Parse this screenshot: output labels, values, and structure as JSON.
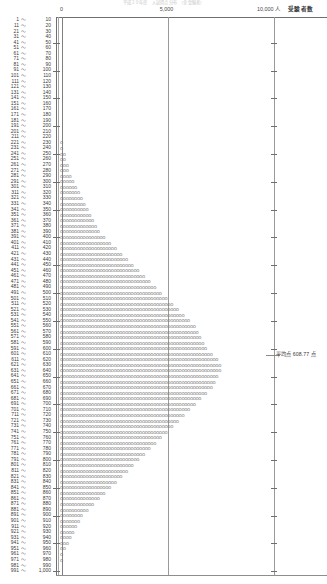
{
  "top_clipped_text": "平成２９年度　入試得点分布　（全受験者）",
  "axis": {
    "unit_suffix": "人",
    "name": "受験者数",
    "ticks": [
      {
        "value": 0,
        "label": "0"
      },
      {
        "value": 5000,
        "label": "5,000"
      },
      {
        "value": 10000,
        "label": "10,000"
      }
    ],
    "xlim": [
      0,
      10000
    ]
  },
  "annotation": {
    "average_label": "平均点 608.77 点",
    "average_value": 608.77
  },
  "chart_data": {
    "type": "bar",
    "orientation": "horizontal",
    "title": "入試得点分布",
    "xlabel": "受験者数",
    "ylabel": "",
    "xlim": [
      0,
      10000
    ],
    "grid": true,
    "legend": null,
    "glyph": "o",
    "glyph_value": 140,
    "categories": [
      "1 ～ 10",
      "11 ～ 20",
      "21 ～ 30",
      "31 ～ 40",
      "41 ～ 50",
      "51 ～ 60",
      "61 ～ 70",
      "71 ～ 80",
      "81 ～ 90",
      "91 ～ 100",
      "101 ～ 110",
      "111 ～ 120",
      "121 ～ 130",
      "131 ～ 140",
      "141 ～ 150",
      "151 ～ 160",
      "161 ～ 170",
      "171 ～ 180",
      "181 ～ 190",
      "191 ～ 200",
      "201 ～ 210",
      "211 ～ 220",
      "221 ～ 230",
      "231 ～ 240",
      "241 ～ 250",
      "251 ～ 260",
      "261 ～ 270",
      "271 ～ 280",
      "281 ～ 290",
      "291 ～ 300",
      "301 ～ 310",
      "311 ～ 320",
      "321 ～ 330",
      "331 ～ 340",
      "341 ～ 350",
      "351 ～ 360",
      "361 ～ 370",
      "371 ～ 380",
      "381 ～ 390",
      "391 ～ 400",
      "401 ～ 410",
      "411 ～ 420",
      "421 ～ 430",
      "431 ～ 440",
      "441 ～ 450",
      "451 ～ 460",
      "461 ～ 470",
      "471 ～ 480",
      "481 ～ 490",
      "491 ～ 500",
      "501 ～ 510",
      "511 ～ 520",
      "521 ～ 530",
      "531 ～ 540",
      "541 ～ 550",
      "551 ～ 560",
      "561 ～ 570",
      "571 ～ 580",
      "581 ～ 590",
      "591 ～ 600",
      "601 ～ 610",
      "611 ～ 620",
      "621 ～ 630",
      "631 ～ 640",
      "641 ～ 650",
      "651 ～ 660",
      "661 ～ 670",
      "671 ～ 680",
      "681 ～ 690",
      "691 ～ 700",
      "701 ～ 710",
      "711 ～ 720",
      "721 ～ 730",
      "731 ～ 740",
      "741 ～ 750",
      "751 ～ 760",
      "761 ～ 770",
      "771 ～ 780",
      "781 ～ 790",
      "791 ～ 800",
      "801 ～ 810",
      "811 ～ 820",
      "821 ～ 830",
      "831 ～ 840",
      "841 ～ 850",
      "851 ～ 860",
      "861 ～ 870",
      "871 ～ 880",
      "881 ～ 890",
      "891 ～ 900",
      "901 ～ 910",
      "911 ～ 920",
      "921 ～ 930",
      "931 ～ 940",
      "941 ～ 950",
      "951 ～ 960",
      "961 ～ 970",
      "971 ～ 980",
      "981 ～ 990",
      "991 ～ 1,000"
    ],
    "values": [
      0,
      0,
      0,
      0,
      0,
      0,
      0,
      0,
      0,
      0,
      0,
      0,
      0,
      0,
      0,
      0,
      0,
      0,
      0,
      0,
      0,
      0,
      140,
      140,
      280,
      280,
      420,
      420,
      560,
      700,
      840,
      980,
      1120,
      1260,
      1400,
      1540,
      1680,
      1820,
      1960,
      2240,
      2520,
      2800,
      3080,
      3360,
      3640,
      3920,
      4200,
      4480,
      4760,
      5040,
      5320,
      5600,
      5880,
      6160,
      6440,
      6720,
      6860,
      7000,
      7140,
      7280,
      7560,
      7840,
      7980,
      7980,
      7840,
      7700,
      7560,
      7280,
      7000,
      6720,
      6440,
      6160,
      5880,
      5600,
      5320,
      5040,
      4760,
      4480,
      4200,
      3920,
      3640,
      3360,
      3080,
      2800,
      2520,
      2240,
      1960,
      1680,
      1400,
      1120,
      980,
      840,
      700,
      560,
      420,
      280,
      140,
      140,
      0,
      0
    ],
    "glyph_counts": [
      0,
      0,
      0,
      0,
      0,
      0,
      0,
      0,
      0,
      0,
      0,
      0,
      0,
      0,
      0,
      0,
      0,
      0,
      0,
      0,
      0,
      0,
      1,
      1,
      2,
      2,
      3,
      3,
      4,
      5,
      6,
      7,
      8,
      9,
      10,
      11,
      12,
      13,
      14,
      16,
      18,
      20,
      22,
      24,
      26,
      28,
      30,
      32,
      34,
      36,
      38,
      40,
      42,
      44,
      46,
      48,
      49,
      50,
      51,
      52,
      54,
      56,
      57,
      57,
      56,
      55,
      54,
      52,
      50,
      48,
      46,
      44,
      42,
      40,
      38,
      36,
      34,
      32,
      30,
      28,
      26,
      24,
      22,
      20,
      18,
      16,
      14,
      12,
      10,
      8,
      7,
      6,
      5,
      4,
      3,
      2,
      1,
      1,
      0,
      0
    ],
    "axis_tick_rows": [
      4,
      9,
      14,
      19,
      24,
      29,
      34,
      39,
      44,
      49,
      54,
      59,
      64,
      69,
      74,
      79,
      84,
      89,
      94,
      99
    ],
    "peak_category": "631 ～ 640",
    "peak_value": 7980,
    "total_label": "受験者数"
  }
}
